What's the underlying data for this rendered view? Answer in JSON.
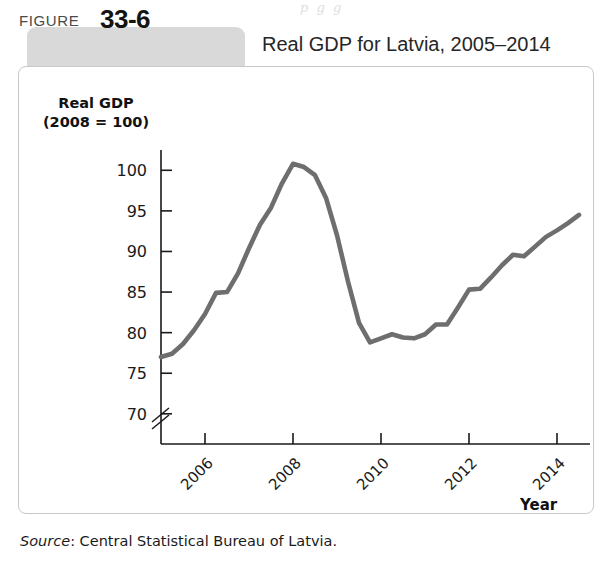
{
  "page": {
    "ghost_text": "p  g      g"
  },
  "figure": {
    "label_word": "FIGURE",
    "number": "33-6",
    "title": "Real GDP for Latvia, 2005–2014",
    "source_prefix": "Source",
    "source_text": ": Central Statistical Bureau of Latvia.",
    "tab_color": "#d9d9d9",
    "panel_border_color": "#c8c8c8"
  },
  "chart_data": {
    "type": "line",
    "title": "Real GDP for Latvia, 2005–2014",
    "xlabel": "Year",
    "ylabel": "Real GDP (2008 = 100)",
    "ylabel_line1": "Real GDP",
    "ylabel_line2": "(2008 = 100)",
    "series_color": "#6e6e6e",
    "grid": false,
    "legend": "none",
    "axis_break_y": true,
    "ylim": [
      68.5,
      102.5
    ],
    "yticks": [
      70,
      75,
      80,
      85,
      90,
      95,
      100
    ],
    "ytick_labels": [
      "70",
      "75",
      "80",
      "85",
      "90",
      "95",
      "100"
    ],
    "xlim": [
      2005.0,
      2014.75
    ],
    "xticks": [
      2006,
      2008,
      2010,
      2012,
      2014
    ],
    "xtick_labels": [
      "2006",
      "2008",
      "2010",
      "2012",
      "2014"
    ],
    "xtick_rotation": 45,
    "x_unit": "quarter",
    "x": [
      2005.0,
      2005.25,
      2005.5,
      2005.75,
      2006.0,
      2006.25,
      2006.5,
      2006.75,
      2007.0,
      2007.25,
      2007.5,
      2007.75,
      2008.0,
      2008.25,
      2008.5,
      2008.75,
      2009.0,
      2009.25,
      2009.5,
      2009.75,
      2010.0,
      2010.25,
      2010.5,
      2010.75,
      2011.0,
      2011.25,
      2011.5,
      2011.75,
      2012.0,
      2012.25,
      2012.5,
      2012.75,
      2013.0,
      2013.25,
      2013.5,
      2013.75,
      2014.0,
      2014.25,
      2014.5
    ],
    "values": [
      77.0,
      77.4,
      78.6,
      80.3,
      82.3,
      84.9,
      85.0,
      87.3,
      90.4,
      93.3,
      95.4,
      98.4,
      100.8,
      100.4,
      99.4,
      96.6,
      92.0,
      86.3,
      81.2,
      78.8,
      79.3,
      79.8,
      79.4,
      79.3,
      79.8,
      81.0,
      81.0,
      83.1,
      85.3,
      85.4,
      86.8,
      88.3,
      89.6,
      89.4,
      90.6,
      91.8,
      92.6,
      93.5,
      94.5
    ],
    "annotations": {
      "peak": {
        "x": 2008.0,
        "y": 100.8,
        "note": "pre-crisis peak"
      },
      "trough": {
        "x": 2009.75,
        "y": 78.8,
        "note": "recession trough"
      },
      "start": {
        "x": 2005.0,
        "y": 77.0
      },
      "end": {
        "x": 2014.5,
        "y": 94.5
      }
    }
  }
}
